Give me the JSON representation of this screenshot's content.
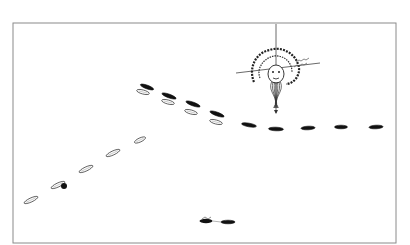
{
  "diagram": {
    "type": "naval-battle-formation",
    "frame": {
      "x": 13,
      "y": 23,
      "w": 383,
      "h": 220,
      "stroke": "#8a8a8a"
    },
    "colors": {
      "filled_fleet": "#111111",
      "outline_fleet": "#333333",
      "compass": "#444444"
    },
    "compass": {
      "center": [
        276,
        68
      ],
      "vertical": {
        "x1": 276,
        "y1": 24,
        "x2": 276,
        "y2": 113
      },
      "horizontal": {
        "x1": 236,
        "y1": 73,
        "x2": 320,
        "y2": 63
      },
      "wind_head": "wind-head-ornament",
      "labels": []
    },
    "fleets": [
      {
        "name": "filled-fleet",
        "style": "filled",
        "ships": [
          {
            "cx": 147,
            "cy": 87,
            "len": 14,
            "angle": 20
          },
          {
            "cx": 169,
            "cy": 96,
            "len": 15,
            "angle": 20
          },
          {
            "cx": 193,
            "cy": 104,
            "len": 15,
            "angle": 20
          },
          {
            "cx": 217,
            "cy": 114,
            "len": 15,
            "angle": 20
          },
          {
            "cx": 249,
            "cy": 125,
            "len": 15,
            "angle": 10
          },
          {
            "cx": 276,
            "cy": 129,
            "len": 15,
            "angle": 2
          },
          {
            "cx": 308,
            "cy": 128,
            "len": 14,
            "angle": -3
          },
          {
            "cx": 341,
            "cy": 127,
            "len": 13,
            "angle": 0
          },
          {
            "cx": 376,
            "cy": 127,
            "len": 14,
            "angle": -3
          },
          {
            "cx": 228,
            "cy": 222,
            "len": 14,
            "angle": 0
          }
        ]
      },
      {
        "name": "outline-fleet",
        "style": "outline",
        "ships": [
          {
            "cx": 143,
            "cy": 92,
            "len": 13,
            "angle": 15
          },
          {
            "cx": 168,
            "cy": 102,
            "len": 13,
            "angle": 15
          },
          {
            "cx": 191,
            "cy": 112,
            "len": 13,
            "angle": 15
          },
          {
            "cx": 216,
            "cy": 122,
            "len": 13,
            "angle": 15
          },
          {
            "cx": 140,
            "cy": 140,
            "len": 12,
            "angle": -25
          },
          {
            "cx": 113,
            "cy": 153,
            "len": 15,
            "angle": -25
          },
          {
            "cx": 86,
            "cy": 169,
            "len": 15,
            "angle": -25
          },
          {
            "cx": 58,
            "cy": 185,
            "len": 15,
            "angle": -25
          },
          {
            "cx": 31,
            "cy": 200,
            "len": 15,
            "angle": -25
          }
        ]
      }
    ],
    "markers": [
      {
        "name": "damaged-ship-blob",
        "cx": 64,
        "cy": 186,
        "r": 3
      },
      {
        "name": "flagship-small",
        "cx": 206,
        "cy": 221,
        "len": 13
      }
    ]
  }
}
